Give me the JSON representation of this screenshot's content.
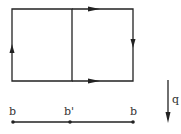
{
  "diagram": {
    "labels": {
      "left_point": "b",
      "middle_point": "b'",
      "right_point": "b",
      "vector": "q"
    },
    "colors": {
      "stroke": "#222222",
      "background": "#ffffff"
    }
  }
}
